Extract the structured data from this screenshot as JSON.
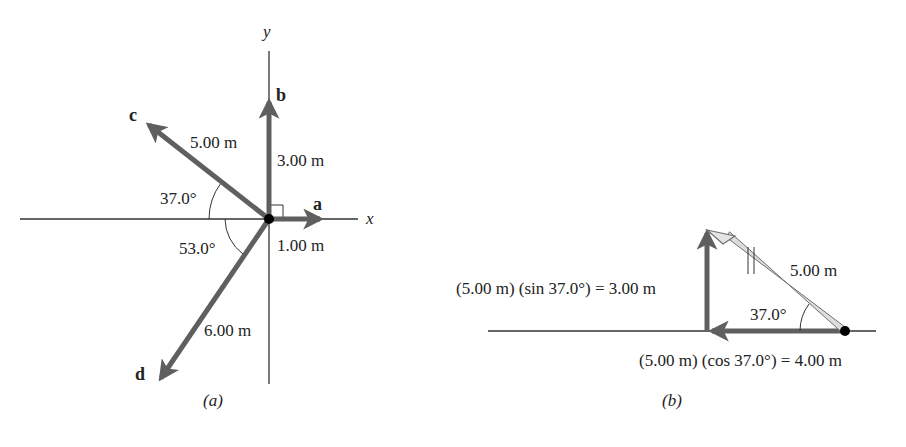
{
  "panel_a": {
    "caption": "(a)",
    "axes": {
      "x_label": "x",
      "y_label": "y"
    },
    "vectors": [
      {
        "name": "a",
        "magnitude": "1.00 m",
        "direction": "along +x"
      },
      {
        "name": "b",
        "magnitude": "3.00 m",
        "direction": "along +y"
      },
      {
        "name": "c",
        "magnitude": "5.00 m",
        "angle_label": "37.0°",
        "angle_ref": "above -x axis"
      },
      {
        "name": "d",
        "magnitude": "6.00 m",
        "angle_label": "53.0°",
        "angle_ref": "below -x axis"
      }
    ]
  },
  "panel_b": {
    "caption": "(b)",
    "hypotenuse_label": "5.00 m",
    "angle_label": "37.0°",
    "vertical_component_label": "(5.00 m) (sin 37.0°) = 3.00 m",
    "horizontal_component_label": "(5.00 m) (cos 37.0°) = 4.00 m"
  },
  "colors": {
    "vector": "#5f5f5f",
    "axis": "#333333",
    "hypotenuse_fill": "#dcdcdc",
    "hypotenuse_stroke": "#707070"
  }
}
